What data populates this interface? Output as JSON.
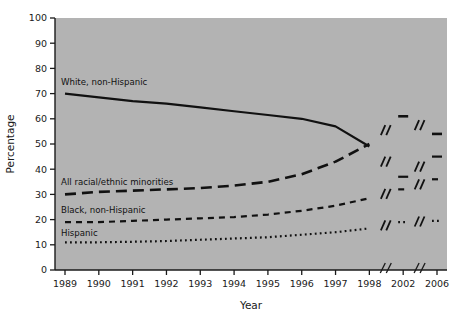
{
  "chart_data": {
    "type": "line",
    "title": "",
    "xlabel": "Year",
    "ylabel": "Percentage",
    "ylim": [
      0,
      100
    ],
    "ytick_step": 10,
    "yticks": [
      0,
      10,
      20,
      30,
      40,
      50,
      60,
      70,
      80,
      90,
      100
    ],
    "categories": [
      "1989",
      "1990",
      "1991",
      "1992",
      "1993",
      "1994",
      "1995",
      "1996",
      "1997",
      "1998",
      "2002",
      "2006"
    ],
    "axis_breaks": [
      "between 1998 and 2002",
      "between 2002 and 2006"
    ],
    "grid": false,
    "legend_position": "inline-labels",
    "plot_background": "#b3b3b3",
    "line_color": "#111111",
    "series": [
      {
        "name": "White, non-Hispanic",
        "label": "White, non-Hispanic",
        "style": "solid",
        "label_x": "1989",
        "label_y": 74,
        "values": [
          70,
          68.5,
          67,
          66,
          64.5,
          63,
          61.5,
          60,
          57,
          49,
          37,
          45
        ]
      },
      {
        "name": "All racial/ethnic minorities",
        "label": "All racial/ethnic minorities",
        "style": "long-dash",
        "label_x": "1989",
        "label_y": 34,
        "values": [
          30,
          31,
          31.5,
          32,
          32.5,
          33.5,
          35,
          38,
          43,
          50,
          61,
          54
        ]
      },
      {
        "name": "Black, non-Hispanic",
        "label": "Black, non-Hispanic",
        "style": "short-dash",
        "label_x": "1989",
        "label_y": 23,
        "values": [
          19,
          19,
          19.5,
          20,
          20.5,
          21,
          22,
          23.5,
          25.5,
          28.5,
          32,
          36
        ]
      },
      {
        "name": "Hispanic",
        "label": "Hispanic",
        "style": "dotted",
        "label_x": "1989",
        "label_y": 14,
        "values": [
          11,
          11,
          11.2,
          11.5,
          12,
          12.5,
          13,
          14,
          15,
          16.5,
          19,
          19.5
        ]
      }
    ]
  }
}
